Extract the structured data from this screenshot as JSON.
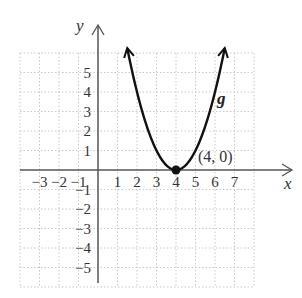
{
  "chart_data": {
    "type": "line",
    "title": "",
    "xlabel": "x",
    "ylabel": "y",
    "xlim": [
      -4,
      8
    ],
    "ylim": [
      -6,
      6
    ],
    "grid": true,
    "x_ticks": [
      -3,
      -2,
      -1,
      1,
      2,
      3,
      4,
      5,
      6,
      7
    ],
    "y_ticks": [
      5,
      4,
      3,
      2,
      1,
      -1,
      -2,
      -3,
      -4,
      -5
    ],
    "x_tick_labels": [
      "−3",
      "−2",
      "−1",
      "1",
      "2",
      "3",
      "4",
      "5",
      "6",
      "7"
    ],
    "y_tick_labels": [
      "5",
      "4",
      "3",
      "2",
      "1",
      "−1",
      "−2",
      "−3",
      "−4",
      "−5"
    ],
    "series": [
      {
        "name": "g",
        "function": "(x-4)^2",
        "x_range": [
          1.5,
          6.5
        ],
        "arrows": "both ends"
      }
    ],
    "points": [
      {
        "x": 4,
        "y": 0,
        "label": "(4, 0)"
      }
    ],
    "legend": "none"
  }
}
